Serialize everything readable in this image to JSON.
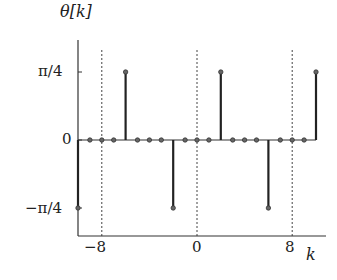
{
  "chart_data": {
    "type": "stem",
    "title": "",
    "ylabel": "θ[k]",
    "xlabel": "k",
    "x_ticks": [
      -8,
      0,
      8
    ],
    "x_tick_labels": [
      "−8",
      "0",
      "8"
    ],
    "y_ticks": [
      -0.7854,
      0,
      0.7854
    ],
    "y_tick_labels": [
      "−π/4",
      "0",
      "π/4"
    ],
    "xlim": [
      -10,
      11.5
    ],
    "ylim": [
      -1.0,
      1.05
    ],
    "grid": "dashed vertical lines at k = -8, 0, 8",
    "x": [
      -10,
      -9,
      -8,
      -7,
      -6,
      -5,
      -4,
      -3,
      -2,
      -1,
      0,
      1,
      2,
      3,
      4,
      5,
      6,
      7,
      8,
      9,
      10
    ],
    "values": [
      -0.7854,
      0,
      0,
      0,
      0.7854,
      0,
      0,
      0,
      -0.7854,
      0,
      0,
      0,
      0.7854,
      0,
      0,
      0,
      -0.7854,
      0,
      0,
      0,
      0.7854
    ],
    "values_symbolic": [
      "-π/4",
      "0",
      "0",
      "0",
      "π/4",
      "0",
      "0",
      "0",
      "-π/4",
      "0",
      "0",
      "0",
      "π/4",
      "0",
      "0",
      "0",
      "-π/4",
      "0",
      "0",
      "0",
      "π/4"
    ]
  },
  "labels": {
    "ylabel": "θ[k]",
    "xlabel": "k",
    "ytick_top": "π/4",
    "ytick_mid": "0",
    "ytick_bot": "−π/4",
    "xtick_left": "−8",
    "xtick_mid": "0",
    "xtick_right": "8"
  }
}
